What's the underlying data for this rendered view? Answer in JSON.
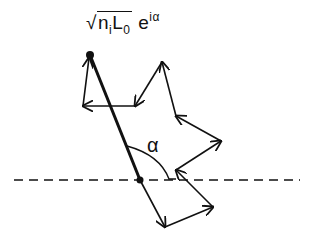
{
  "diagram": {
    "formula": {
      "radical_sign": "√",
      "n": "n",
      "n_sub": "i",
      "L": "L",
      "L_sub": "0",
      "exp_base": "e",
      "exp_power": "iα"
    },
    "angle_label": "α",
    "caption_clipped": "",
    "colors": {
      "ink": "#111111",
      "background": "#ffffff"
    },
    "resultant": {
      "from": [
        140,
        180
      ],
      "to": [
        90,
        55
      ],
      "stroke_width": 3
    },
    "path_points": [
      [
        140,
        180
      ],
      [
        165,
        227
      ],
      [
        213,
        207
      ],
      [
        176,
        170
      ],
      [
        221,
        141
      ],
      [
        176,
        116
      ],
      [
        162,
        62
      ],
      [
        135,
        106
      ],
      [
        83,
        106
      ],
      [
        90,
        56
      ]
    ],
    "axis": {
      "y": 180,
      "x_start": 14,
      "x_end": 300,
      "style": "dashed"
    }
  }
}
